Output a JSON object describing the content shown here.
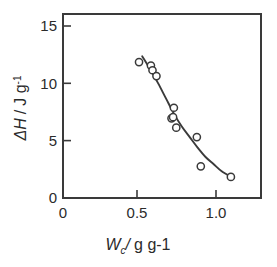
{
  "chart_data": {
    "type": "scatter",
    "title": "",
    "subtitle": "",
    "xlabel": "W_c / g g-1",
    "xlabel_parts": {
      "symbol": "W",
      "subscript": "c",
      "separator": "/",
      "units": "g g-1"
    },
    "ylabel": "ΔH / J g-1",
    "ylabel_parts": {
      "symbol": "ΔH",
      "separator": "/",
      "units": "J g",
      "unit_exponent": "-1"
    },
    "xlim": [
      0,
      1.25
    ],
    "ylim": [
      0,
      15.7
    ],
    "xticks": [
      0,
      0.5,
      1.0
    ],
    "xtick_labels": [
      "0",
      "0.5",
      "1.0"
    ],
    "yticks": [
      0,
      5,
      10,
      15
    ],
    "ytick_labels": [
      "0",
      "5",
      "10",
      "15"
    ],
    "grid": false,
    "legend": false,
    "legend_position": "none",
    "marker": "open-circle",
    "marker_color": "#3a3a3a",
    "marker_fill": "#ffffff",
    "curve_color": "#3a3a3a",
    "axis_color": "#3a3a3a",
    "background": "#ffffff",
    "series": [
      {
        "name": "enthalpy-vs-water-content",
        "x": [
          0.48,
          0.555,
          0.565,
          0.59,
          0.685,
          0.7,
          0.695,
          0.715,
          0.845,
          0.87,
          1.06
        ],
        "y": [
          11.6,
          11.3,
          10.9,
          10.4,
          6.8,
          7.7,
          6.9,
          6.0,
          5.2,
          2.7,
          1.8
        ]
      }
    ],
    "fit_curve": {
      "name": "trend-line",
      "x": [
        0.5,
        0.55,
        0.6,
        0.65,
        0.7,
        0.75,
        0.8,
        0.85,
        0.9,
        0.95,
        1.0,
        1.06
      ],
      "y": [
        12.1,
        11.0,
        9.8,
        8.5,
        7.2,
        6.1,
        5.2,
        4.3,
        3.5,
        2.9,
        2.3,
        1.8
      ]
    },
    "annotations": []
  }
}
